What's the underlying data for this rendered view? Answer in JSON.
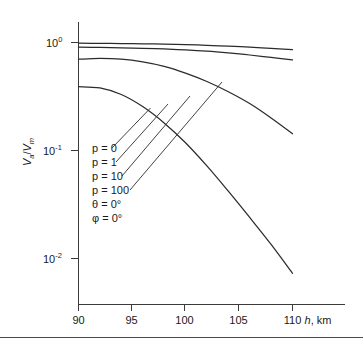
{
  "figure": {
    "background_color": "#ffffff",
    "line_color": "#2b2b2b",
    "axis_color": "#3a3a3a"
  },
  "axes": {
    "x": {
      "title_var": "h",
      "title_unit": ", km",
      "ticks": [
        "90",
        "95",
        "100",
        "105",
        "110"
      ],
      "tick_values": [
        90,
        95,
        100,
        105,
        110
      ],
      "range": [
        90,
        110
      ]
    },
    "y": {
      "title_num": "V",
      "title_num_sub": "a",
      "title_den": "V",
      "title_den_sub": "m",
      "title_slash": "/",
      "ticks": [
        "10",
        "10",
        "10"
      ],
      "tick_exponents": [
        "0",
        "-1",
        "-2"
      ],
      "tick_values": [
        1,
        0.1,
        0.01
      ],
      "scale": "log",
      "range": [
        0.005,
        1.4
      ]
    }
  },
  "legend": {
    "position": "inside-left",
    "items": [
      {
        "label": "p = 0",
        "param": "p",
        "value": "0"
      },
      {
        "label": "p = 1",
        "param": "p",
        "value": "1"
      },
      {
        "label": "p = 10",
        "param": "p",
        "value": "10"
      },
      {
        "label": "p = 100",
        "param": "p",
        "value": "100"
      },
      {
        "label": "θ = 0°",
        "param": "θ",
        "value": "0°"
      },
      {
        "label": "φ = 0°",
        "param": "φ",
        "value": "0°"
      }
    ]
  },
  "chart_data": {
    "type": "line",
    "title": "",
    "subtitle": "",
    "xlabel": "h, km",
    "ylabel": "Va/Vm",
    "xlim": [
      90,
      110
    ],
    "ylim": [
      0.005,
      1.4
    ],
    "yscale": "log",
    "xscale": "linear",
    "grid": false,
    "legend_position": "inside-left",
    "x": [
      90,
      92,
      94,
      96,
      98,
      100,
      102,
      104,
      106,
      108,
      110
    ],
    "series": [
      {
        "name": "p = 0",
        "values": [
          0.985,
          0.982,
          0.978,
          0.973,
          0.966,
          0.956,
          0.942,
          0.925,
          0.905,
          0.882,
          0.858
        ]
      },
      {
        "name": "p = 1",
        "values": [
          0.905,
          0.9,
          0.893,
          0.884,
          0.871,
          0.853,
          0.83,
          0.8,
          0.766,
          0.728,
          0.69
        ]
      },
      {
        "name": "p = 10",
        "values": [
          0.7,
          0.712,
          0.7,
          0.66,
          0.6,
          0.52,
          0.435,
          0.35,
          0.272,
          0.2,
          0.143
        ]
      },
      {
        "name": "p = 100",
        "values": [
          0.39,
          0.38,
          0.33,
          0.255,
          0.18,
          0.118,
          0.072,
          0.042,
          0.024,
          0.0135,
          0.0073
        ]
      }
    ],
    "annotations": [
      {
        "text": "p = 0",
        "points_to_series": "p = 0"
      },
      {
        "text": "p = 1",
        "points_to_series": "p = 1"
      },
      {
        "text": "p = 10",
        "points_to_series": "p = 10"
      },
      {
        "text": "p = 100",
        "points_to_series": "p = 100"
      },
      {
        "text": "θ = 0°"
      },
      {
        "text": "φ = 0°"
      }
    ]
  }
}
